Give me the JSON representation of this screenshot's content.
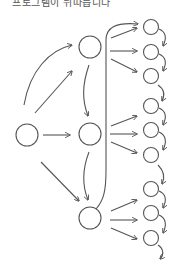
{
  "caption": "프로그램이 뒤따릅니다",
  "diagram": {
    "stroke_color": "#555555",
    "root": {
      "cx": 27,
      "cy": 135,
      "r": 11
    },
    "middle": [
      {
        "cx": 90,
        "cy": 47,
        "r": 11
      },
      {
        "cx": 90,
        "cy": 134,
        "r": 11
      },
      {
        "cx": 90,
        "cy": 218,
        "r": 11
      }
    ],
    "leaves": [
      {
        "cx": 151,
        "cy": 27
      },
      {
        "cx": 151,
        "cy": 52
      },
      {
        "cx": 151,
        "cy": 76
      },
      {
        "cx": 151,
        "cy": 106
      },
      {
        "cx": 151,
        "cy": 130
      },
      {
        "cx": 151,
        "cy": 155
      },
      {
        "cx": 151,
        "cy": 189
      },
      {
        "cx": 151,
        "cy": 213
      },
      {
        "cx": 151,
        "cy": 238
      }
    ],
    "leaf_radius": 7.5
  }
}
